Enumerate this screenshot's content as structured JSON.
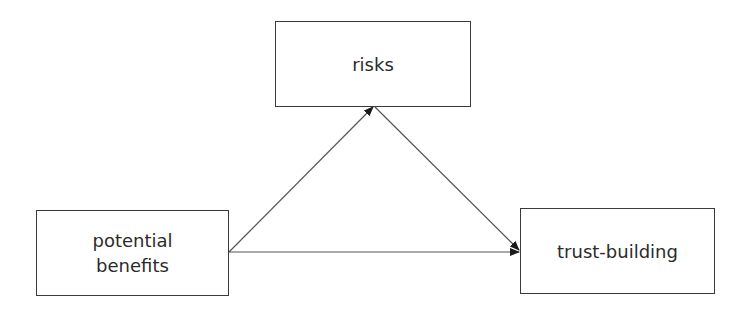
{
  "diagram": {
    "type": "mediation-model",
    "nodes": [
      {
        "id": "risks",
        "label": "risks"
      },
      {
        "id": "potential_benefits",
        "label_lines": [
          "potential",
          "benefits"
        ]
      },
      {
        "id": "trust_building",
        "label": "trust-building"
      }
    ],
    "edges": [
      {
        "from": "potential_benefits",
        "to": "risks",
        "arrow": "end"
      },
      {
        "from": "risks",
        "to": "trust_building",
        "arrow": "end"
      },
      {
        "from": "potential_benefits",
        "to": "trust_building",
        "arrow": "end"
      }
    ],
    "colors": {
      "border": "#3a3a3a",
      "line": "#555555",
      "text": "#2b2b2b",
      "background": "#ffffff"
    }
  }
}
